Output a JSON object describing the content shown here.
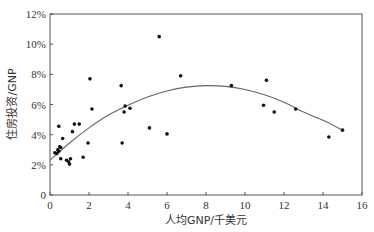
{
  "chart_data": {
    "type": "scatter",
    "title": "",
    "xlabel": "人均GNP/千美元",
    "ylabel": "住房投资/GNP",
    "xlim": [
      0,
      16
    ],
    "ylim": [
      0,
      12
    ],
    "x_ticks": [
      0,
      2,
      4,
      6,
      8,
      10,
      12,
      14,
      16
    ],
    "x_tick_labels": [
      "0",
      "2",
      "4",
      "6",
      "8",
      "10",
      "12",
      "14",
      "16"
    ],
    "y_ticks": [
      0,
      2,
      4,
      6,
      8,
      10,
      12
    ],
    "y_tick_labels": [
      "0",
      "2%",
      "4%",
      "6%",
      "8%",
      "10%",
      "12%"
    ],
    "grid": false,
    "legend": null,
    "series": [
      {
        "name": "countries",
        "kind": "scatter",
        "points": [
          [
            0.25,
            2.8
          ],
          [
            0.35,
            2.75
          ],
          [
            0.4,
            3.0
          ],
          [
            0.45,
            2.9
          ],
          [
            0.45,
            4.55
          ],
          [
            0.5,
            3.2
          ],
          [
            0.55,
            3.15
          ],
          [
            0.55,
            2.4
          ],
          [
            0.65,
            3.75
          ],
          [
            0.85,
            2.3
          ],
          [
            0.95,
            2.2
          ],
          [
            1.0,
            2.05
          ],
          [
            1.05,
            2.4
          ],
          [
            1.15,
            4.2
          ],
          [
            1.25,
            4.7
          ],
          [
            1.5,
            4.7
          ],
          [
            1.7,
            2.5
          ],
          [
            1.95,
            3.45
          ],
          [
            2.05,
            7.7
          ],
          [
            2.15,
            5.7
          ],
          [
            3.65,
            7.25
          ],
          [
            3.7,
            3.45
          ],
          [
            3.8,
            5.5
          ],
          [
            3.85,
            5.9
          ],
          [
            4.1,
            5.75
          ],
          [
            5.1,
            4.45
          ],
          [
            5.6,
            10.5
          ],
          [
            6.0,
            4.05
          ],
          [
            6.7,
            7.9
          ],
          [
            9.3,
            7.25
          ],
          [
            10.95,
            5.95
          ],
          [
            11.1,
            7.6
          ],
          [
            11.5,
            5.5
          ],
          [
            12.6,
            5.7
          ],
          [
            14.3,
            3.85
          ],
          [
            15.0,
            4.3
          ]
        ]
      },
      {
        "name": "quadratic fit",
        "kind": "line",
        "x": [
          0,
          1,
          2,
          3,
          4,
          5,
          6,
          7,
          8,
          9,
          10,
          11,
          12,
          13,
          14,
          15
        ],
        "values": [
          2.3,
          3.45,
          4.45,
          5.3,
          5.95,
          6.5,
          6.9,
          7.15,
          7.25,
          7.2,
          7.0,
          6.65,
          6.15,
          5.5,
          4.95,
          4.3
        ]
      }
    ]
  }
}
